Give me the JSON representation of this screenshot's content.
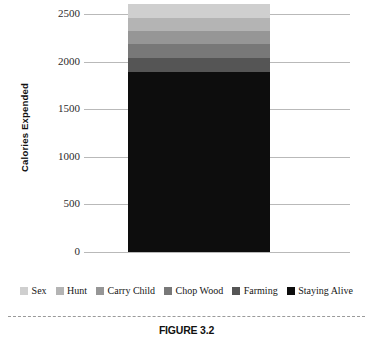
{
  "figure": {
    "caption": "FIGURE 3.2"
  },
  "chart_data": {
    "type": "bar",
    "stacked": true,
    "title": "",
    "xlabel": "",
    "ylabel": "Calories Expended",
    "categories": [
      ""
    ],
    "ylim": [
      0,
      2700
    ],
    "yticks": [
      0,
      500,
      1000,
      1500,
      2000,
      2500
    ],
    "ytick_labels": [
      "0",
      "500",
      "1000",
      "1500",
      "2000",
      "2500"
    ],
    "grid": true,
    "legend_position": "bottom",
    "total": 2610,
    "series": [
      {
        "name": "Staying Alive",
        "values": [
          1890
        ],
        "color": "#0d0d0d",
        "y0": 0,
        "y1": 1890
      },
      {
        "name": "Farming",
        "values": [
          150
        ],
        "color": "#555555",
        "y0": 1890,
        "y1": 2040
      },
      {
        "name": "Chop Wood",
        "values": [
          140
        ],
        "color": "#787878",
        "y0": 2040,
        "y1": 2180
      },
      {
        "name": "Carry Child",
        "values": [
          140
        ],
        "color": "#969696",
        "y0": 2180,
        "y1": 2320
      },
      {
        "name": "Hunt",
        "values": [
          140
        ],
        "color": "#b4b4b4",
        "y0": 2320,
        "y1": 2460
      },
      {
        "name": "Sex",
        "values": [
          150
        ],
        "color": "#cfcfcf",
        "y0": 2460,
        "y1": 2610
      }
    ],
    "legend": [
      {
        "label": "Sex",
        "color": "#cfcfcf"
      },
      {
        "label": "Hunt",
        "color": "#b4b4b4"
      },
      {
        "label": "Carry Child",
        "color": "#969696"
      },
      {
        "label": "Chop Wood",
        "color": "#787878"
      },
      {
        "label": "Farming",
        "color": "#555555"
      },
      {
        "label": "Staying Alive",
        "color": "#0d0d0d"
      }
    ]
  }
}
